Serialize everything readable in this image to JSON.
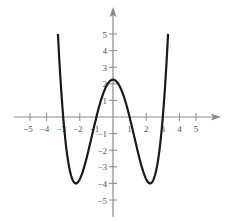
{
  "chart_data": {
    "type": "line",
    "title": "",
    "xlabel": "",
    "ylabel": "",
    "xlim": [
      -5.5,
      6.3
    ],
    "ylim": [
      -6,
      6.4
    ],
    "grid": false,
    "legend": null,
    "x_ticks": [
      -5,
      -4,
      -3,
      -2,
      -1,
      1,
      2,
      3,
      4,
      5
    ],
    "y_ticks": [
      -5,
      -4,
      -3,
      -2,
      -1,
      1,
      2,
      3,
      4,
      5
    ],
    "x_tick_labels": [
      "−5",
      "−4",
      "−3",
      "−2",
      "−1",
      "1",
      "2",
      "3",
      "4",
      "5"
    ],
    "y_tick_labels": [
      "−5",
      "−4",
      "−3",
      "−2",
      "−1",
      "1",
      "2",
      "3",
      "4",
      "5"
    ],
    "series": [
      {
        "name": "f(x)",
        "formula": "0.25*(x^2-1)*(x^2-9)",
        "x_range": [
          -3.317,
          3.317
        ],
        "key_points": [
          {
            "x": -3.317,
            "y": 5
          },
          {
            "x": -3,
            "y": 0
          },
          {
            "x": -2.236,
            "y": -4
          },
          {
            "x": -1,
            "y": 0
          },
          {
            "x": 0,
            "y": 2.25
          },
          {
            "x": 1,
            "y": 0
          },
          {
            "x": 2.236,
            "y": -4
          },
          {
            "x": 3,
            "y": 0
          },
          {
            "x": 3.317,
            "y": 5
          }
        ]
      }
    ]
  },
  "style": {
    "axis_color": "#8a8a8a",
    "curve_color": "#1a1a1a",
    "label_color": "#555555"
  }
}
